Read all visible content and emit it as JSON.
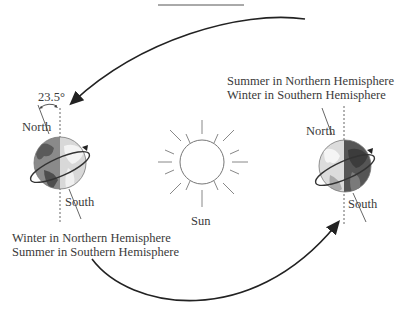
{
  "diagram": {
    "sun_label": "Sun",
    "tilt_angle": "23.5°",
    "left_earth": {
      "north_label": "North",
      "south_label": "South",
      "season_line1": "Winter in Northern Hemisphere",
      "season_line2": "Summer in Southern Hemisphere"
    },
    "right_earth": {
      "north_label": "North",
      "south_label": "South",
      "season_line1": "Summer in Northern Hemisphere",
      "season_line2": "Winter in Southern Hemisphere"
    }
  },
  "colors": {
    "ocean_dark": "#6e6e6e",
    "ocean_light": "#bdbdbd",
    "land_dark": "#4a4a4a",
    "land_light": "#ececec",
    "line": "#333333"
  }
}
